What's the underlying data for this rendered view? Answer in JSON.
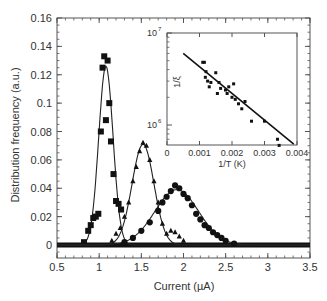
{
  "chart_data": [
    {
      "type": "scatter",
      "title": "",
      "xlabel": "Current (µA)",
      "ylabel": "Distribution frequency (a.u.)",
      "xlim": [
        0.5,
        3.5
      ],
      "ylim": [
        -0.006,
        0.16
      ],
      "x_ticks": [
        "0.5",
        "1",
        "1.5",
        "2",
        "2.5",
        "3",
        "3.5"
      ],
      "y_ticks": [
        "0",
        "0.02",
        "0.04",
        "0.06",
        "0.08",
        "0.1",
        "0.12",
        "0.14",
        "0.16"
      ],
      "grid": false,
      "legend": null,
      "series": [
        {
          "name": "squares",
          "marker": "square",
          "points": [
            [
              0.82,
              0.002
            ],
            [
              0.87,
              0.01
            ],
            [
              0.9,
              0.014
            ],
            [
              0.93,
              0.019
            ],
            [
              0.96,
              0.02
            ],
            [
              0.99,
              0.022
            ],
            [
              1.02,
              0.08
            ],
            [
              1.04,
              0.125
            ],
            [
              1.06,
              0.133
            ],
            [
              1.08,
              0.088
            ],
            [
              1.1,
              0.13
            ],
            [
              1.12,
              0.1
            ],
            [
              1.14,
              0.073
            ],
            [
              1.17,
              0.05
            ],
            [
              1.2,
              0.031
            ],
            [
              1.23,
              0.029
            ],
            [
              1.26,
              0.025
            ]
          ],
          "fit_peak": {
            "center": 1.08,
            "height": 0.126,
            "sigma": 0.085
          }
        },
        {
          "name": "triangles",
          "marker": "triangle",
          "points": [
            [
              1.15,
              0.003
            ],
            [
              1.2,
              0.008
            ],
            [
              1.25,
              0.012
            ],
            [
              1.3,
              0.02
            ],
            [
              1.35,
              0.03
            ],
            [
              1.4,
              0.045
            ],
            [
              1.44,
              0.055
            ],
            [
              1.48,
              0.066
            ],
            [
              1.52,
              0.072
            ],
            [
              1.56,
              0.07
            ],
            [
              1.6,
              0.06
            ],
            [
              1.65,
              0.045
            ],
            [
              1.7,
              0.03
            ],
            [
              1.75,
              0.015
            ],
            [
              1.8,
              0.008
            ],
            [
              1.85,
              0.01
            ],
            [
              1.9,
              0.009
            ],
            [
              1.95,
              0.006
            ],
            [
              2.0,
              0.003
            ]
          ],
          "fit_peak": {
            "center": 1.52,
            "height": 0.071,
            "sigma": 0.13
          }
        },
        {
          "name": "circles",
          "marker": "circle",
          "points": [
            [
              1.3,
              0.002
            ],
            [
              1.4,
              0.005
            ],
            [
              1.5,
              0.01
            ],
            [
              1.6,
              0.016
            ],
            [
              1.7,
              0.024
            ],
            [
              1.75,
              0.03
            ],
            [
              1.8,
              0.034
            ],
            [
              1.85,
              0.038
            ],
            [
              1.9,
              0.042
            ],
            [
              1.95,
              0.04
            ],
            [
              2.0,
              0.036
            ],
            [
              2.05,
              0.033
            ],
            [
              2.1,
              0.028
            ],
            [
              2.15,
              0.022
            ],
            [
              2.2,
              0.018
            ],
            [
              2.25,
              0.014
            ],
            [
              2.3,
              0.012
            ],
            [
              2.35,
              0.009
            ],
            [
              2.4,
              0.007
            ],
            [
              2.45,
              0.005
            ],
            [
              2.5,
              0.003
            ],
            [
              2.6,
              0.001
            ]
          ],
          "fit_peak": {
            "center": 1.92,
            "height": 0.039,
            "sigma": 0.26
          }
        }
      ]
    },
    {
      "type": "scatter",
      "title": "inset",
      "xlabel": "1/T (K)",
      "ylabel": "1/ξ",
      "xlim": [
        0,
        0.004
      ],
      "ylim_log": [
        500000,
        10000000
      ],
      "x_ticks": [
        "0",
        "0.001",
        "0.002",
        "0.003",
        "0.004"
      ],
      "y_ticks": [
        "10^6",
        "10^7"
      ],
      "y_scale": "log",
      "grid": false,
      "points": [
        [
          0.0011,
          4800000
        ],
        [
          0.00115,
          4800000
        ],
        [
          0.0012,
          3800000
        ],
        [
          0.00118,
          3300000
        ],
        [
          0.00125,
          3000000
        ],
        [
          0.0013,
          2600000
        ],
        [
          0.00135,
          2900000
        ],
        [
          0.0015,
          3700000
        ],
        [
          0.00155,
          2200000
        ],
        [
          0.0016,
          2900000
        ],
        [
          0.00165,
          2500000
        ],
        [
          0.0018,
          2400000
        ],
        [
          0.00185,
          2200000
        ],
        [
          0.0019,
          2600000
        ],
        [
          0.002,
          2000000
        ],
        [
          0.00205,
          2800000
        ],
        [
          0.0021,
          1900000
        ],
        [
          0.0022,
          1700000
        ],
        [
          0.0023,
          1500000
        ],
        [
          0.0024,
          1800000
        ],
        [
          0.0026,
          1100000
        ],
        [
          0.003,
          1100000
        ],
        [
          0.0034,
          700000
        ],
        [
          0.00345,
          600000
        ]
      ],
      "fit_line": {
        "x": [
          0.0005,
          0.0039
        ],
        "y": [
          6000000,
          620000
        ]
      }
    }
  ],
  "labels": {
    "main_xlabel": "Current (µA)",
    "main_ylabel": "Distribution frequency (a.u.)",
    "inset_xlabel": "1/T (K)",
    "inset_ylabel": "1/ξ",
    "inset_y_top": "10",
    "inset_y_top_exp": "7",
    "inset_y_bottom": "10",
    "inset_y_bottom_exp": "6"
  }
}
